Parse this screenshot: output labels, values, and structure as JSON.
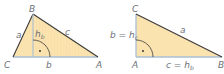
{
  "colors": {
    "fill": "#fbe3b0",
    "hatch": "#f3cf86",
    "edge_dark": "#3b3b3b",
    "edge_blue": "#a9bfd6",
    "label": "#6d7178"
  },
  "left_triangle": {
    "vertices": {
      "A": "A",
      "B": "B",
      "C": "C"
    },
    "sides": {
      "a": "a",
      "b": "b",
      "c": "c"
    },
    "altitude": {
      "main": "h",
      "sub": "b"
    },
    "right_angle_dot": "•"
  },
  "right_triangle": {
    "vertices": {
      "A": "A",
      "B": "B",
      "C": "C"
    },
    "sides": {
      "a": "a",
      "b_eq": {
        "main": "b = h",
        "sub": "c"
      },
      "c_eq": {
        "main": "c = h",
        "sub": "b"
      }
    },
    "right_angle_dot": "•"
  }
}
